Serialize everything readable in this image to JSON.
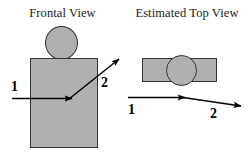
{
  "figure": {
    "background_color": "#ffffff",
    "shape_fill_color": "#b0b0b0",
    "shape_stroke_color": "#333333",
    "arrow_color": "#000000",
    "text_color": "#1a1a1a"
  },
  "panels": [
    {
      "id": "frontal",
      "title": "Frontal View",
      "shapes": [
        {
          "name": "head",
          "type": "circle"
        },
        {
          "name": "body",
          "type": "rectangle"
        }
      ],
      "arrows": [
        {
          "label": "1",
          "direction": "horizontal-right"
        },
        {
          "label": "2",
          "direction": "diagonal-up-right"
        }
      ]
    },
    {
      "id": "top",
      "title": "Estimated Top View",
      "shapes": [
        {
          "name": "slab",
          "type": "rectangle"
        },
        {
          "name": "head",
          "type": "circle"
        }
      ],
      "arrows": [
        {
          "label": "1",
          "direction": "horizontal-right"
        },
        {
          "label": "2",
          "direction": "slight-down-right"
        }
      ]
    }
  ]
}
